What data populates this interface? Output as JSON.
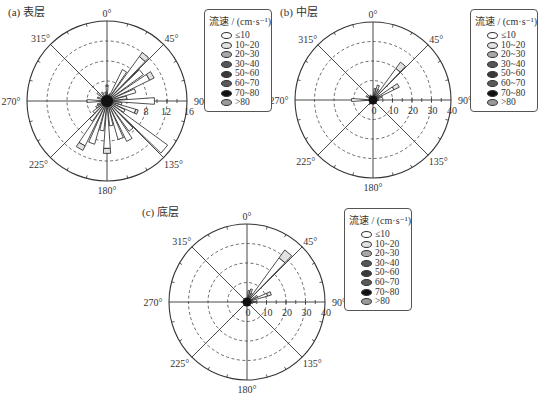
{
  "chart_data": [
    {
      "type": "rose",
      "title": "(a) 表层",
      "panel_label": "(a)",
      "layer": "表层",
      "center": [
        107,
        101
      ],
      "radius": 80,
      "rmax": 16,
      "radial_ticks": [
        4,
        8,
        12,
        16
      ],
      "radial_tick_labels": [
        "8",
        "12",
        "16"
      ],
      "direction_labels": [
        "0°",
        "45°",
        "90°",
        "135°",
        "180°",
        "225°",
        "270°",
        "315°"
      ],
      "sector_width_deg": 10,
      "petals": [
        {
          "dir": 0,
          "value": 3.2,
          "bins": [
            3.0,
            0.2
          ]
        },
        {
          "dir": 20,
          "value": 1.5,
          "bins": [
            1.5
          ]
        },
        {
          "dir": 30,
          "value": 7.0,
          "bins": [
            7.0
          ]
        },
        {
          "dir": 40,
          "value": 12.0,
          "bins": [
            11.0,
            1.0
          ]
        },
        {
          "dir": 50,
          "value": 9.0,
          "bins": [
            9.0
          ]
        },
        {
          "dir": 60,
          "value": 10.5,
          "bins": [
            9.5,
            1.0
          ]
        },
        {
          "dir": 70,
          "value": 6.0,
          "bins": [
            6.0
          ]
        },
        {
          "dir": 80,
          "value": 4.0,
          "bins": [
            4.0
          ]
        },
        {
          "dir": 90,
          "value": 9.5,
          "bins": [
            9.5
          ]
        },
        {
          "dir": 100,
          "value": 3.0,
          "bins": [
            3.0
          ]
        },
        {
          "dir": 110,
          "value": 6.5,
          "bins": [
            6.0,
            0.5
          ]
        },
        {
          "dir": 120,
          "value": 4.0,
          "bins": [
            4.0
          ]
        },
        {
          "dir": 130,
          "value": 15.0,
          "bins": [
            15.0
          ]
        },
        {
          "dir": 140,
          "value": 7.5,
          "bins": [
            7.5
          ]
        },
        {
          "dir": 150,
          "value": 9.0,
          "bins": [
            9.0
          ]
        },
        {
          "dir": 160,
          "value": 8.0,
          "bins": [
            8.0
          ]
        },
        {
          "dir": 170,
          "value": 5.0,
          "bins": [
            5.0
          ]
        },
        {
          "dir": 180,
          "value": 10.5,
          "bins": [
            9.5,
            1.0
          ]
        },
        {
          "dir": 190,
          "value": 6.0,
          "bins": [
            6.0
          ]
        },
        {
          "dir": 200,
          "value": 9.0,
          "bins": [
            9.0
          ]
        },
        {
          "dir": 210,
          "value": 11.0,
          "bins": [
            10.0,
            1.0
          ]
        },
        {
          "dir": 220,
          "value": 5.0,
          "bins": [
            5.0
          ]
        },
        {
          "dir": 230,
          "value": 3.5,
          "bins": [
            3.5
          ]
        },
        {
          "dir": 240,
          "value": 2.5,
          "bins": [
            2.5
          ]
        },
        {
          "dir": 250,
          "value": 2.0,
          "bins": [
            2.0
          ]
        },
        {
          "dir": 270,
          "value": 4.0,
          "bins": [
            4.0
          ]
        },
        {
          "dir": 290,
          "value": 2.0,
          "bins": [
            2.0
          ]
        },
        {
          "dir": 310,
          "value": 2.5,
          "bins": [
            2.5
          ]
        },
        {
          "dir": 330,
          "value": 2.0,
          "bins": [
            2.0
          ]
        },
        {
          "dir": 350,
          "value": 1.8,
          "bins": [
            1.8
          ]
        }
      ]
    },
    {
      "type": "rose",
      "title": "(b) 中层",
      "panel_label": "(b)",
      "layer": "中层",
      "center": [
        373,
        100
      ],
      "radius": 78,
      "rmax": 40,
      "radial_ticks": [
        10,
        20,
        30,
        40
      ],
      "radial_tick_labels": [
        "0",
        "10",
        "20",
        "30",
        "40"
      ],
      "direction_labels": [
        "0°",
        "45°",
        "90°",
        "135°",
        "180°",
        "225°",
        "270°",
        "315°"
      ],
      "sector_width_deg": 10,
      "petals": [
        {
          "dir": 10,
          "value": 6.0,
          "bins": [
            6.0
          ]
        },
        {
          "dir": 20,
          "value": 8.0,
          "bins": [
            8.0
          ]
        },
        {
          "dir": 30,
          "value": 6.0,
          "bins": [
            6.0
          ]
        },
        {
          "dir": 40,
          "value": 24.0,
          "bins": [
            20.0,
            4.0
          ]
        },
        {
          "dir": 50,
          "value": 4.0,
          "bins": [
            4.0
          ]
        },
        {
          "dir": 60,
          "value": 15.0,
          "bins": [
            12.0,
            3.0
          ]
        },
        {
          "dir": 70,
          "value": 5.0,
          "bins": [
            5.0
          ]
        },
        {
          "dir": 90,
          "value": 3.0,
          "bins": [
            3.0
          ]
        },
        {
          "dir": 180,
          "value": 2.0,
          "bins": [
            2.0
          ]
        },
        {
          "dir": 220,
          "value": 3.0,
          "bins": [
            3.0
          ]
        },
        {
          "dir": 270,
          "value": 11.0,
          "bins": [
            11.0
          ]
        },
        {
          "dir": 300,
          "value": 4.0,
          "bins": [
            4.0
          ]
        },
        {
          "dir": 330,
          "value": 3.0,
          "bins": [
            3.0
          ]
        }
      ]
    },
    {
      "type": "rose",
      "title": "(c) 底层",
      "panel_label": "(c)",
      "layer": "底层",
      "center": [
        247,
        302
      ],
      "radius": 78,
      "rmax": 40,
      "radial_ticks": [
        10,
        20,
        30,
        40
      ],
      "radial_tick_labels": [
        "0",
        "10",
        "20",
        "30",
        "40"
      ],
      "direction_labels": [
        "0°",
        "45°",
        "90°",
        "135°",
        "180°",
        "225°",
        "270°",
        "315°"
      ],
      "sector_width_deg": 10,
      "petals": [
        {
          "dir": 10,
          "value": 6.0,
          "bins": [
            6.0
          ]
        },
        {
          "dir": 20,
          "value": 7.0,
          "bins": [
            7.0
          ]
        },
        {
          "dir": 30,
          "value": 5.0,
          "bins": [
            5.0
          ]
        },
        {
          "dir": 40,
          "value": 33.0,
          "bins": [
            28.0,
            5.0
          ]
        },
        {
          "dir": 60,
          "value": 6.0,
          "bins": [
            6.0
          ]
        },
        {
          "dir": 70,
          "value": 13.0,
          "bins": [
            11.0,
            2.0
          ]
        },
        {
          "dir": 90,
          "value": 5.0,
          "bins": [
            5.0
          ]
        },
        {
          "dir": 100,
          "value": 3.0,
          "bins": [
            3.0
          ]
        },
        {
          "dir": 200,
          "value": 2.0,
          "bins": [
            2.0
          ]
        },
        {
          "dir": 270,
          "value": 3.0,
          "bins": [
            3.0
          ]
        },
        {
          "dir": 330,
          "value": 2.0,
          "bins": [
            2.0
          ]
        }
      ]
    }
  ],
  "legend": {
    "title": "流速 / (cm·s⁻¹)",
    "items": [
      {
        "label": "≤10",
        "color": "#ffffff"
      },
      {
        "label": "10~20",
        "color": "#e2e2e2"
      },
      {
        "label": "20~30",
        "color": "#a8a8a8"
      },
      {
        "label": "30~40",
        "color": "#555555"
      },
      {
        "label": "50~60",
        "color": "#3a3a3a"
      },
      {
        "label": "60~70",
        "color": "#5a5a5a"
      },
      {
        "label": "70~80",
        "color": "#111111"
      },
      {
        "label": ">80",
        "color": "#9a9a9a"
      }
    ]
  },
  "panels": {
    "a": {
      "title": "(a)  表层"
    },
    "b": {
      "title": "(b)  中层"
    },
    "c": {
      "title": "(c)  底层"
    }
  }
}
